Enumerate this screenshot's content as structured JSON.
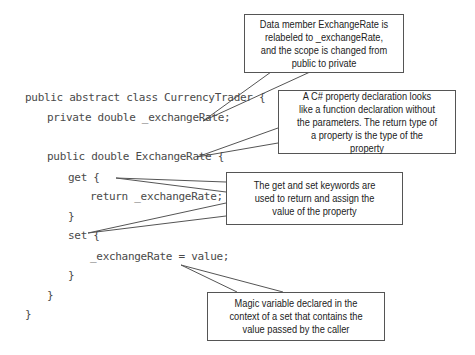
{
  "code_lines": [
    "public abstract class CurrencyTrader {",
    "private double _exchangeRate;",
    "public double ExchangeRate {",
    "get {",
    "return _exchangeRate;",
    "}",
    "set {",
    "_exchangeRate = value;",
    "}",
    "}",
    "}"
  ],
  "callouts": [
    {
      "text": "Data member ExchangeRate is relabeled to _exchangeRate, and the scope is changed from public to private"
    },
    {
      "text": "A C# property declaration looks like a function declaration without the parameters. The return type of a property is the type of the property"
    },
    {
      "text": "The get and set keywords are used to return and assign the value of the property"
    },
    {
      "text": "Magic variable declared in the context of a set that contains the value passed by the caller"
    }
  ],
  "colors": {
    "code_text": "#4a4a4a",
    "callout_border": "#555555",
    "leader_line": "#555555"
  }
}
